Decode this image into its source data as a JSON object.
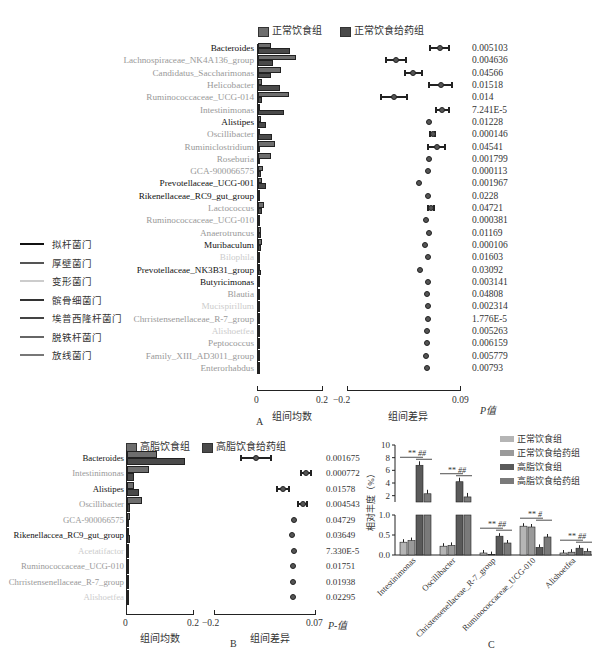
{
  "chart_data": [
    {
      "panel": "A",
      "type": "bar",
      "subtype": "extended-error-bar (STAMP)",
      "legend": [
        "正常饮食组",
        "正常饮食给药组"
      ],
      "categories": [
        "Bacteroides",
        "Lachnospiraceae_NK4A136_group",
        "Candidatus_Saccharimonas",
        "Helicobacter",
        "Ruminococcaceae_UCG-014",
        "Intestinimonas",
        "Alistipes",
        "Oscillibacter",
        "Ruminiclostridium",
        "Roseburia",
        "GCA-900066575",
        "Prevotellaceae_UCG-001",
        "Rikenellaceae_RC9_gut_group",
        "Lactococcus",
        "Ruminococcaceae_UCG-010",
        "Anaerotruncus",
        "Muribaculum",
        "Bilophila",
        "Prevotellaceae_NK3B31_group",
        "Butyricimonas",
        "Blautia",
        "Mucispirillum",
        "Chrristensenellaceae_R-7_group",
        "Alishoetfea",
        "Peptococcus",
        "Family_XIII_AD3011_group",
        "Enterorhabdus"
      ],
      "series": [
        {
          "name": "正常饮食组",
          "values": [
            0.04,
            0.12,
            0.072,
            0.011,
            0.096,
            0.004,
            0.009,
            0.003,
            0.052,
            0.04,
            0.015,
            0.012,
            0.003,
            0.018,
            0.005,
            0.008,
            0.012,
            0.002,
            0.004,
            0.004,
            0.003,
            0.004,
            0.004,
            0.001,
            0.003,
            0.003,
            0.002
          ]
        },
        {
          "name": "正常饮食给药组",
          "values": [
            0.1,
            0.048,
            0.042,
            0.068,
            0.014,
            0.08,
            0.026,
            0.045,
            0.003,
            0.002,
            0.01,
            0.024,
            0.002,
            0.012,
            0.003,
            0.01,
            0.01,
            0.003,
            0.008,
            0.004,
            0.002,
            0.004,
            0.004,
            0.001,
            0.002,
            0.002,
            0.001
          ]
        }
      ],
      "difference": {
        "values": [
          0.038,
          -0.075,
          -0.03,
          0.04,
          -0.08,
          0.045,
          0.01,
          0.02,
          0.03,
          0.01,
          0.008,
          -0.015,
          0.008,
          0.015,
          0.002,
          0.01,
          0.0,
          0.008,
          -0.012,
          0.008,
          0.006,
          0.008,
          0.008,
          0.006,
          0.006,
          0.004,
          0.006
        ],
        "ci_half": [
          0.025,
          0.026,
          0.022,
          0.03,
          0.034,
          0.016,
          0.004,
          0.007,
          0.022,
          0.002,
          0.002,
          0.004,
          0.002,
          0.007,
          0.002,
          0.002,
          0.002,
          0.002,
          0.004,
          0.001,
          0.001,
          0.001,
          0.001,
          0.001,
          0.001,
          0.001,
          0.001
        ]
      },
      "p_values": [
        "0.005103",
        "0.004636",
        "0.04566",
        "0.01518",
        "0.014",
        "7.241E-5",
        "0.01228",
        "0.000146",
        "0.04541",
        "0.001799",
        "0.000113",
        "0.001967",
        "0.0228",
        "0.04721",
        "0.000381",
        "0.01169",
        "0.000106",
        "0.01603",
        "0.03092",
        "0.003141",
        "0.04808",
        "0.002314",
        "1.776E-5",
        "0.005263",
        "0.006159",
        "0.005779",
        "0.00793"
      ],
      "label_colors": [
        "#111",
        "#999",
        "#999",
        "#999",
        "#999",
        "#999",
        "#111",
        "#999",
        "#999",
        "#999",
        "#999",
        "#111",
        "#111",
        "#999",
        "#999",
        "#999",
        "#111",
        "#ccc",
        "#111",
        "#111",
        "#999",
        "#ccc",
        "#999",
        "#ccc",
        "#999",
        "#999",
        "#999"
      ],
      "xlabel_mean": "组间均数",
      "xlim_mean": [
        0,
        0.2
      ],
      "xlabel_diff": "组间差异",
      "xlim_diff": [
        -0.2,
        0.09
      ],
      "p_header": "P值",
      "panel_label": "A"
    },
    {
      "panel": "B",
      "type": "bar",
      "subtype": "extended-error-bar (STAMP)",
      "legend": [
        "高脂饮食组",
        "高脂饮食给药组"
      ],
      "categories": [
        "Bacteroides",
        "Intestinimonas",
        "Alistipes",
        "Oscillibacter",
        "GCA-900066575",
        "Rikenellaccea_RC9_gut_group",
        "Acetatifactor",
        "Ruminococcaceae_UCG-010",
        "Chrristensenellaceae_R-7_group",
        "Alishoetfea"
      ],
      "series": [
        {
          "name": "高脂饮食组",
          "values": [
            0.09,
            0.066,
            0.02,
            0.045,
            0.01,
            0.004,
            0.006,
            0.002,
            0.002,
            0.001
          ]
        },
        {
          "name": "高脂饮食给药组",
          "values": [
            0.176,
            0.02,
            0.036,
            0.008,
            0.005,
            0.008,
            0.004,
            0.002,
            0.002,
            0.001
          ]
        }
      ],
      "difference": {
        "values": [
          -0.088,
          0.046,
          -0.016,
          0.037,
          0.013,
          0.008,
          0.015,
          0.01,
          0.011,
          0.012
        ],
        "ci_half": [
          0.04,
          0.014,
          0.016,
          0.012,
          0.002,
          0.002,
          0.002,
          0.002,
          0.002,
          0.002
        ]
      },
      "p_values": [
        "0.001675",
        "0.000772",
        "0.01578",
        "0.004543",
        "0.04729",
        "0.03649",
        "7.330E-5",
        "0.01751",
        "0.01938",
        "0.02295"
      ],
      "label_colors": [
        "#111",
        "#999",
        "#111",
        "#999",
        "#999",
        "#111",
        "#ccc",
        "#999",
        "#999",
        "#ccc"
      ],
      "xlabel_mean": "组间均数",
      "xlim_mean": [
        0,
        0.2
      ],
      "xlabel_diff": "组间差异",
      "xlim_diff": [
        -0.2,
        0.07
      ],
      "p_header": "P-值",
      "panel_label": "B"
    },
    {
      "panel": "C",
      "type": "bar",
      "subtype": "grouped bar with broken y-axis",
      "categories": [
        "Intestinimonas",
        "Oscillibacter",
        "Christensenellaceae_R-7_group",
        "Ruminococcaceae_UCG-010",
        "Alishoetfea"
      ],
      "series": [
        {
          "name": "正常饮食组",
          "color": "#b5b5b5",
          "values": [
            0.32,
            0.22,
            0.05,
            0.72,
            0.05
          ]
        },
        {
          "name": "正常饮食给药组",
          "color": "#9a9a9a",
          "values": [
            0.36,
            0.24,
            0.01,
            0.7,
            0.07
          ]
        },
        {
          "name": "高脂饮食组",
          "color": "#5a5a5a",
          "values": [
            6.8,
            4.2,
            0.47,
            0.19,
            0.17
          ]
        },
        {
          "name": "高脂饮食给药组",
          "color": "#7a7a7a",
          "values": [
            2.3,
            1.8,
            0.3,
            0.45,
            0.09
          ]
        }
      ],
      "significance": [
        [
          "**",
          "##"
        ],
        [
          "**",
          "##"
        ],
        [
          "**",
          "##"
        ],
        [
          "**",
          "#"
        ],
        [
          "**",
          "##"
        ]
      ],
      "ylabel": "相对丰度（%）",
      "yticks_lower": [
        "0.0",
        "0.5",
        "1.0"
      ],
      "yticks_upper": [
        "2",
        "4",
        "6",
        "8",
        "10"
      ],
      "panel_label": "C"
    }
  ],
  "phylum_legend": [
    {
      "label": "拟杆菌门",
      "color": "#111111"
    },
    {
      "label": "厚壁菌门",
      "color": "#555555"
    },
    {
      "label": "变形菌门",
      "color": "#cccccc"
    },
    {
      "label": "髌骨细菌门",
      "color": "#333333"
    },
    {
      "label": "埃普西隆杆菌门",
      "color": "#444444"
    },
    {
      "label": "脱铁杆菌门",
      "color": "#666666"
    },
    {
      "label": "放线菌门",
      "color": "#777777"
    }
  ],
  "ui": {
    "A": {
      "legend1": "正常饮食组",
      "legend2": "正常饮食给药组",
      "tick0": "0",
      "tick02": "0.2",
      "tickm02": "−0.2",
      "tick009": "0.09",
      "xlabel_mean": "组间均数",
      "xlabel_diff": "组间差异",
      "p_header": "P值",
      "panel": "A"
    },
    "B": {
      "legend1": "高脂饮食组",
      "legend2": "高脂饮食给药组",
      "tick0": "0",
      "tick02": "0.2",
      "tickm02": "−0.2",
      "tick007": "0.07",
      "xlabel_mean": "组间均数",
      "xlabel_diff": "组间差异",
      "p_header": "P-值",
      "panel": "B"
    },
    "C": {
      "panel": "C",
      "ylabel": "相对丰度（%）"
    }
  },
  "colors": {
    "bar_group1": "#6e6e6e",
    "bar_group2": "#4a4a4a",
    "axis": "#222222"
  }
}
